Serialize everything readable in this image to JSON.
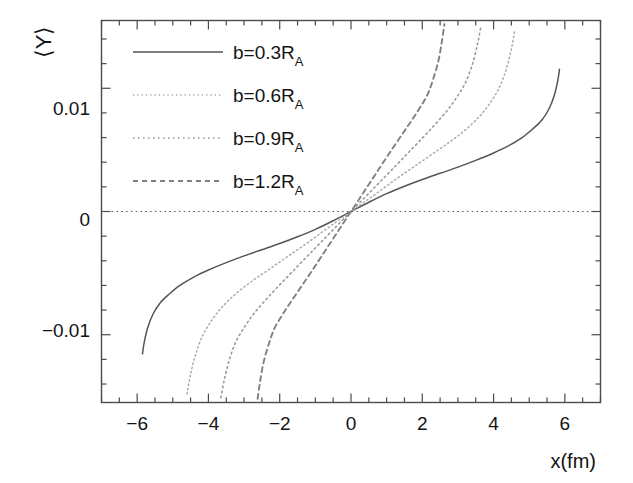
{
  "chart_data": {
    "type": "line",
    "title": "",
    "xlabel": "x(fm)",
    "ylabel": "⟨Y⟩",
    "xlim": [
      -7.0,
      7.0
    ],
    "ylim": [
      -0.0155,
      0.0155
    ],
    "grid": false,
    "legend_position": "top-left-inside",
    "x_ticks": [
      -6,
      -4,
      -2,
      0,
      2,
      4,
      6
    ],
    "x_tick_labels": [
      "−6",
      "−4",
      "−2",
      "0",
      "2",
      "4",
      "6"
    ],
    "x_minor_step": 0.5,
    "y_ticks": [
      -0.01,
      0,
      0.01
    ],
    "y_tick_labels": [
      "−0.01",
      "0",
      "0.01"
    ],
    "y_minor_step": 0.002,
    "zero_reference_line": true,
    "series": [
      {
        "name": "b=0.3R_A",
        "label_main": "b=0.3R",
        "label_sub": "A",
        "style": "solid",
        "color": "#555555",
        "x": [
          -5.85,
          -5.8,
          -5.7,
          -5.55,
          -5.35,
          -5.1,
          -4.8,
          -4.4,
          -4.0,
          -3.5,
          -3.0,
          -2.5,
          -2.0,
          -1.5,
          -1.0,
          -0.5,
          0.0,
          0.5,
          1.0,
          1.5,
          2.0,
          2.5,
          3.0,
          3.5,
          4.0,
          4.4,
          4.8,
          5.1,
          5.35,
          5.55,
          5.7,
          5.8,
          5.85
        ],
        "y": [
          -0.01155,
          -0.0106,
          -0.0094,
          -0.0083,
          -0.0074,
          -0.0067,
          -0.006,
          -0.0053,
          -0.00475,
          -0.00415,
          -0.0036,
          -0.0031,
          -0.0026,
          -0.00205,
          -0.00145,
          -0.00075,
          0.0,
          0.00075,
          0.00145,
          0.00205,
          0.0026,
          0.0031,
          0.0036,
          0.00415,
          0.00475,
          0.0053,
          0.006,
          0.0067,
          0.0074,
          0.0083,
          0.0094,
          0.0106,
          0.01155
        ]
      },
      {
        "name": "b=0.6R_A",
        "label_main": "b=0.6R",
        "label_sub": "A",
        "style": "dotted-fine",
        "color": "#aaaaaa",
        "x": [
          -4.6,
          -4.5,
          -4.35,
          -4.15,
          -3.9,
          -3.6,
          -3.2,
          -2.8,
          -2.4,
          -2.0,
          -1.6,
          -1.2,
          -0.8,
          -0.4,
          0.0,
          0.4,
          0.8,
          1.2,
          1.6,
          2.0,
          2.4,
          2.8,
          3.2,
          3.6,
          3.9,
          4.15,
          4.35,
          4.5,
          4.6
        ],
        "y": [
          -0.0148,
          -0.0132,
          -0.0115,
          -0.01,
          -0.0088,
          -0.0077,
          -0.0066,
          -0.0057,
          -0.0049,
          -0.0041,
          -0.0033,
          -0.0025,
          -0.00165,
          -0.00082,
          0.0,
          0.00082,
          0.00165,
          0.0025,
          0.0033,
          0.0041,
          0.0049,
          0.0057,
          0.0066,
          0.0077,
          0.0088,
          0.01,
          0.0115,
          0.0132,
          0.0148
        ]
      },
      {
        "name": "b=0.9R_A",
        "label_main": "b=0.9R",
        "label_sub": "A",
        "style": "dotted-med",
        "color": "#9a9a9a",
        "x": [
          -3.65,
          -3.55,
          -3.4,
          -3.2,
          -2.95,
          -2.7,
          -2.4,
          -2.1,
          -1.8,
          -1.5,
          -1.2,
          -0.9,
          -0.6,
          -0.3,
          0.0,
          0.3,
          0.6,
          0.9,
          1.2,
          1.5,
          1.8,
          2.1,
          2.4,
          2.7,
          2.95,
          3.2,
          3.4,
          3.55,
          3.65
        ],
        "y": [
          -0.0151,
          -0.0136,
          -0.0119,
          -0.0104,
          -0.0092,
          -0.0082,
          -0.0072,
          -0.00625,
          -0.00535,
          -0.00445,
          -0.00355,
          -0.00266,
          -0.00177,
          -0.00088,
          0.0,
          0.00088,
          0.00177,
          0.00266,
          0.00355,
          0.00445,
          0.00535,
          0.00625,
          0.0072,
          0.0082,
          0.0092,
          0.0104,
          0.0119,
          0.0136,
          0.0151
        ]
      },
      {
        "name": "b=1.2R_A",
        "label_main": "b=1.2R",
        "label_sub": "A",
        "style": "dashed",
        "color": "#808080",
        "x": [
          -2.62,
          -2.55,
          -2.45,
          -2.3,
          -2.15,
          -1.95,
          -1.75,
          -1.55,
          -1.35,
          -1.15,
          -0.95,
          -0.75,
          -0.55,
          -0.35,
          -0.18,
          0.0,
          0.18,
          0.35,
          0.55,
          0.75,
          0.95,
          1.15,
          1.35,
          1.55,
          1.75,
          1.95,
          2.15,
          2.3,
          2.45,
          2.55,
          2.62
        ],
        "y": [
          -0.0152,
          -0.0138,
          -0.0122,
          -0.0107,
          -0.0095,
          -0.0085,
          -0.0076,
          -0.00675,
          -0.0059,
          -0.00505,
          -0.00418,
          -0.0033,
          -0.00242,
          -0.00154,
          -0.00079,
          0.0,
          0.00079,
          0.00154,
          0.00242,
          0.0033,
          0.00418,
          0.00505,
          0.0059,
          0.00675,
          0.0076,
          0.0085,
          0.0095,
          0.0107,
          0.0122,
          0.0138,
          0.0152
        ]
      }
    ]
  },
  "axes": {
    "x_title": "x(fm)",
    "y_title": "⟨Y⟩",
    "x_labels": [
      "−6",
      "−4",
      "−2",
      "0",
      "2",
      "4",
      "6"
    ],
    "y_labels": [
      "0.01",
      "0",
      "−0.01"
    ]
  },
  "legend": {
    "entries": [
      {
        "main": "b=0.3R",
        "sub": "A"
      },
      {
        "main": "b=0.6R",
        "sub": "A"
      },
      {
        "main": "b=0.9R",
        "sub": "A"
      },
      {
        "main": "b=1.2R",
        "sub": "A"
      }
    ]
  },
  "colors": {
    "frame": "#4a4a4a",
    "text": "#141414",
    "background": "#ffffff"
  }
}
